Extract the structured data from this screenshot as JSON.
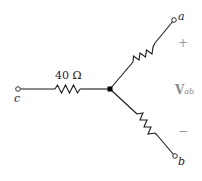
{
  "diagram": {
    "type": "wye-circuit",
    "center_node": {
      "x": 110,
      "y": 89
    },
    "terminals": [
      {
        "id": "a",
        "label": "a",
        "x": 174,
        "y": 20
      },
      {
        "id": "b",
        "label": "b",
        "x": 175,
        "y": 156
      },
      {
        "id": "c",
        "label": "c",
        "x": 18,
        "y": 89
      }
    ],
    "resistors": [
      {
        "branch": "c",
        "label": "40 Ω"
      },
      {
        "branch": "a",
        "label": ""
      },
      {
        "branch": "b",
        "label": ""
      }
    ],
    "voltage": {
      "plus": "+",
      "minus": "−",
      "symbol": "V",
      "subscript": "ab"
    },
    "colors": {
      "wire": "#1a1a1a",
      "label": "#222222",
      "annotation": "#9a9a9a"
    }
  }
}
